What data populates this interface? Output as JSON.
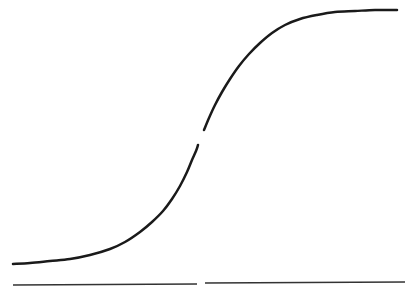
{
  "figure": {
    "background_color": "#ffffff",
    "width": 410,
    "height": 296
  },
  "style": {
    "curve_color": "#1a1a1a",
    "curve_width": 2.5,
    "axis_color": "#333333",
    "axis_width": 1.6
  },
  "chart_data": {
    "type": "line",
    "title": "",
    "subtitle": "",
    "xlabel": "",
    "ylabel": "",
    "xlim": [
      0,
      410
    ],
    "ylim": [
      296,
      0
    ],
    "grid": false,
    "legend": null,
    "legend_position": "none",
    "annotations": [],
    "tick_labels": {
      "x": [],
      "y": []
    },
    "series": [
      {
        "name": "sigmoid-lower-branch",
        "color": "#1a1a1a",
        "stroke_width": 2.5,
        "points": [
          [
            13,
            264
          ],
          [
            30,
            263
          ],
          [
            50,
            261
          ],
          [
            70,
            259
          ],
          [
            90,
            255
          ],
          [
            110,
            249
          ],
          [
            125,
            242
          ],
          [
            140,
            232
          ],
          [
            152,
            222
          ],
          [
            163,
            211
          ],
          [
            172,
            199
          ],
          [
            180,
            186
          ],
          [
            187,
            172
          ],
          [
            192,
            160
          ],
          [
            196,
            151
          ],
          [
            198,
            145
          ]
        ]
      },
      {
        "name": "sigmoid-upper-branch",
        "color": "#1a1a1a",
        "stroke_width": 2.5,
        "points": [
          [
            204,
            130
          ],
          [
            209,
            118
          ],
          [
            215,
            105
          ],
          [
            222,
            92
          ],
          [
            230,
            79
          ],
          [
            239,
            66
          ],
          [
            249,
            54
          ],
          [
            260,
            43
          ],
          [
            272,
            33
          ],
          [
            285,
            25
          ],
          [
            300,
            19
          ],
          [
            317,
            15
          ],
          [
            335,
            12
          ],
          [
            355,
            11
          ],
          [
            375,
            10
          ],
          [
            397,
            10
          ]
        ]
      },
      {
        "name": "baseline-left-segment",
        "color": "#333333",
        "stroke_width": 1.6,
        "points": [
          [
            13,
            285
          ],
          [
            197,
            284
          ]
        ]
      },
      {
        "name": "baseline-right-segment",
        "color": "#333333",
        "stroke_width": 1.6,
        "points": [
          [
            205,
            283
          ],
          [
            405,
            282
          ]
        ]
      }
    ],
    "gaps": [
      {
        "name": "curve-discontinuity",
        "x_start": 198,
        "x_end": 204,
        "y_start": 145,
        "y_end": 130
      },
      {
        "name": "baseline-discontinuity",
        "x_start": 197,
        "x_end": 205,
        "y_start": 284,
        "y_end": 283
      }
    ]
  }
}
